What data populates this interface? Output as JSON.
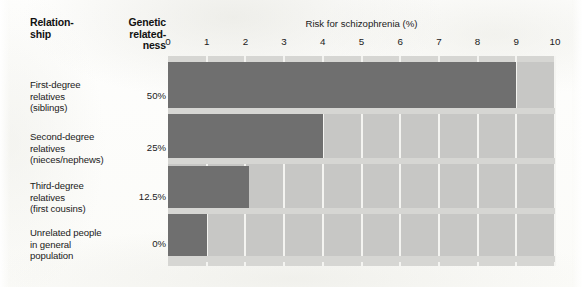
{
  "chart_data": {
    "type": "bar",
    "orientation": "horizontal",
    "title": "",
    "xlabel": "Risk for schizophrenia (%)",
    "ylabel": "",
    "xlim": [
      0,
      10
    ],
    "xticks": [
      0,
      1,
      2,
      3,
      4,
      5,
      6,
      7,
      8,
      9,
      10
    ],
    "grid": true,
    "legend": null,
    "categories": [
      "First-degree relatives (siblings)",
      "Second-degree relatives (nieces/nephews)",
      "Third-degree relatives (first cousins)",
      "Unrelated people in general population"
    ],
    "values": [
      9,
      4,
      2.1,
      1
    ],
    "secondary_axis_label": "Genetic relatedness",
    "secondary_values": [
      "50%",
      "25%",
      "12.5%",
      "0%"
    ],
    "colors": {
      "bar": "#6f6f6f",
      "track": "#c7c7c5",
      "gridline": "#f4f4f1",
      "text": "#1a1a1a",
      "page": "#fdfdfb"
    }
  },
  "table": {
    "headers": {
      "relationship": "Relation-\nship",
      "relationship_line1": "Relation-",
      "relationship_line2": "ship",
      "genetic_line1": "Genetic",
      "genetic_line2": "related-",
      "genetic_line3": "ness"
    },
    "rows": [
      {
        "label_line1": "First-degree",
        "label_line2": "relatives",
        "label_line3": "(siblings)",
        "genetic": "50%",
        "risk": 9
      },
      {
        "label_line1": "Second-degree",
        "label_line2": "relatives",
        "label_line3": "(nieces/nephews)",
        "genetic": "25%",
        "risk": 4
      },
      {
        "label_line1": "Third-degree",
        "label_line2": "relatives",
        "label_line3": "(first cousins)",
        "genetic": "12.5%",
        "risk": 2.1
      },
      {
        "label_line1": "Unrelated people",
        "label_line2": "in general",
        "label_line3": "population",
        "genetic": "0%",
        "risk": 1
      }
    ]
  },
  "axis": {
    "title": "Risk for schizophrenia (%)",
    "tick_0": "0",
    "tick_1": "1",
    "tick_2": "2",
    "tick_3": "3",
    "tick_4": "4",
    "tick_5": "5",
    "tick_6": "6",
    "tick_7": "7",
    "tick_8": "8",
    "tick_9": "9",
    "tick_10": "10"
  }
}
